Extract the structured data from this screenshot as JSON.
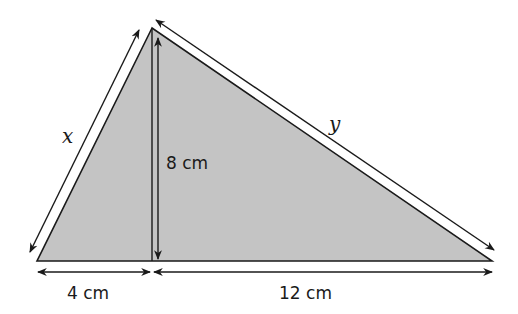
{
  "diagram": {
    "type": "right-triangle-split-by-altitude",
    "fill_color": "#c4c4c4",
    "stroke_color": "#1a1a1a",
    "vertices": {
      "apex": [
        152,
        28
      ],
      "base_left": [
        37,
        261
      ],
      "base_right": [
        492,
        261
      ],
      "altitude_foot": [
        152,
        261
      ]
    },
    "labels": {
      "left_side": "x",
      "right_side": "y",
      "altitude": "8 cm",
      "base_left_segment": "4 cm",
      "base_right_segment": "12 cm"
    }
  }
}
